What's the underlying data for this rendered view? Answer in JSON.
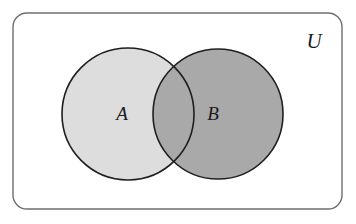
{
  "figure": {
    "background_color": "#ffffff"
  },
  "universe": {
    "label": "U",
    "name": "universal-set",
    "frame": {
      "x": 13,
      "y": 13,
      "width": 329,
      "height": 196,
      "corner_radius": 14,
      "stroke_color": "#6f6f6f",
      "stroke_width": 1.4,
      "fill_color": "#ffffff"
    },
    "label_position": {
      "x": 314,
      "y": 48
    }
  },
  "sets": [
    {
      "label": "A",
      "name": "set-a",
      "cx": 128,
      "cy": 114,
      "r": 66,
      "fill_color": "#dddddd",
      "stroke_color": "#1f1f1f",
      "stroke_width": 1.6,
      "label_position": {
        "x": 122,
        "y": 120
      }
    },
    {
      "label": "B",
      "name": "set-b",
      "cx": 218,
      "cy": 114,
      "r": 65,
      "fill_color": "#a9a9a9",
      "stroke_color": "#1f1f1f",
      "stroke_width": 1.6,
      "label_position": {
        "x": 213,
        "y": 120
      }
    }
  ],
  "intersection": {
    "name": "intersection-a-b",
    "fill_color": "#a9a9a9",
    "shaded": true
  },
  "colors": {
    "set_a_fill": "#dddddd",
    "set_b_fill": "#a9a9a9",
    "outline": "#1f1f1f",
    "frame": "#6f6f6f",
    "text": "#1a1a1a",
    "background": "#ffffff"
  }
}
